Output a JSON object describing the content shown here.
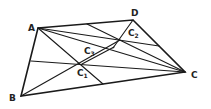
{
  "diagram": {
    "title": "",
    "points": {
      "A": {
        "label": "A",
        "x": 38,
        "y": 28
      },
      "B": {
        "label": "B",
        "x": 21,
        "y": 96
      },
      "C": {
        "label": "C",
        "x": 185,
        "y": 72
      },
      "D": {
        "label": "D",
        "x": 133,
        "y": 20
      },
      "C1": {
        "label": "C",
        "sub": "1",
        "x": 82,
        "y": 64
      },
      "C2": {
        "label": "C",
        "sub": "2",
        "x": 120,
        "y": 40
      },
      "C3": {
        "label": "C",
        "sub": "3",
        "x": 114,
        "y": 48
      }
    },
    "stroke_color": "#1a1a1a"
  }
}
